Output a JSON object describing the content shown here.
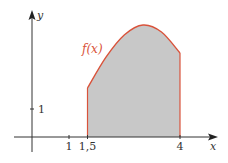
{
  "figure": {
    "function_label": "f(x)",
    "x_axis_label": "x",
    "y_axis_label": "y",
    "x_ticks": [
      "1",
      "1,5",
      "4"
    ],
    "y_ticks": [
      "1"
    ],
    "colors": {
      "curve": "#d9533b",
      "fill": "#c8c8c8",
      "axis": "#333333"
    }
  },
  "chart_data": {
    "type": "area",
    "title": "",
    "xlabel": "x",
    "ylabel": "y",
    "function_label": "f(x)",
    "shaded_interval": [
      1.5,
      4
    ],
    "x_ticks": [
      {
        "value": 1,
        "label": "1"
      },
      {
        "value": 1.5,
        "label": "1,5"
      },
      {
        "value": 4,
        "label": "4"
      }
    ],
    "y_ticks": [
      {
        "value": 1,
        "label": "1"
      }
    ],
    "x": [
      1.5,
      2.0,
      2.5,
      3.0,
      3.5,
      4.0
    ],
    "y": [
      1.75,
      2.85,
      3.65,
      4.0,
      3.75,
      3.0
    ],
    "xlim": [
      -0.5,
      5
    ],
    "ylim": [
      -0.5,
      4.5
    ],
    "grid": false
  }
}
